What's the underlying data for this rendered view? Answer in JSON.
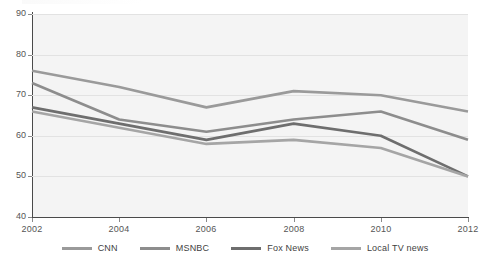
{
  "chart_data": {
    "type": "line",
    "title": "",
    "subtitle": "",
    "xlabel": "",
    "ylabel": "",
    "x": [
      2002,
      2004,
      2006,
      2008,
      2010,
      2012
    ],
    "categories": [
      "2002",
      "2004",
      "2006",
      "2008",
      "2010",
      "2012"
    ],
    "xlim": [
      2002,
      2012
    ],
    "ylim": [
      40,
      90
    ],
    "yticks": [
      40,
      50,
      60,
      70,
      80,
      90
    ],
    "xticks": [
      2002,
      2004,
      2006,
      2008,
      2010,
      2012
    ],
    "ytick_labels": [
      "40",
      "50",
      "60",
      "70",
      "80",
      "90"
    ],
    "xtick_labels": [
      "2002",
      "2004",
      "2006",
      "2008",
      "2010",
      "2012"
    ],
    "grid": "horizontal",
    "legend_position": "bottom",
    "series": [
      {
        "name": "CNN",
        "values": [
          76,
          72,
          67,
          71,
          70,
          66
        ],
        "color": "#9a9a9a"
      },
      {
        "name": "MSNBC",
        "values": [
          73,
          64,
          61,
          64,
          66,
          59
        ],
        "color": "#8d8d8d"
      },
      {
        "name": "Fox News",
        "values": [
          67,
          63,
          59,
          63,
          60,
          50
        ],
        "color": "#6e6e6e"
      },
      {
        "name": "Local TV news",
        "values": [
          66,
          62,
          58,
          59,
          57,
          50
        ],
        "color": "#a5a5a5"
      }
    ]
  },
  "legend": {
    "items": [
      {
        "label": "CNN"
      },
      {
        "label": "MSNBC"
      },
      {
        "label": "Fox News"
      },
      {
        "label": "Local TV news"
      }
    ]
  },
  "axes": {
    "y_labels": [
      "90",
      "80",
      "70",
      "60",
      "50",
      "40"
    ],
    "x_labels": [
      "2002",
      "2004",
      "2006",
      "2008",
      "2010",
      "2012"
    ]
  },
  "style": {
    "plot_background": "#f4f4f4",
    "gridline_color": "#e2e2e2",
    "axis_color": "#4a4a4a",
    "tick_label_color": "#555555",
    "legend_label_color": "#3f3f3f"
  }
}
